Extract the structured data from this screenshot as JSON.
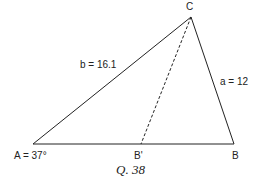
{
  "diagram": {
    "vertices": {
      "A": {
        "label": "A = 37°"
      },
      "B": {
        "label": "B"
      },
      "C": {
        "label": "C"
      },
      "B_prime": {
        "label": "B'"
      }
    },
    "sides": {
      "b": {
        "label": "b = 16.1"
      },
      "a": {
        "label": "a = 12"
      }
    },
    "caption": "Q. 38"
  }
}
